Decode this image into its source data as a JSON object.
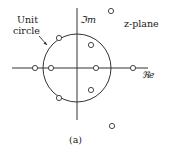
{
  "diagram": {
    "plane_label": "z-plane",
    "imag_axis_label": "ℑm",
    "real_axis_label": "ℜe",
    "unit_circle_label_line1": "Unit",
    "unit_circle_label_line2": "circle",
    "caption": "(a)",
    "colors": {
      "stroke": "#333333",
      "background": "#ffffff"
    },
    "zeros": [
      {
        "x": 35,
        "y": 68,
        "desc": "on real axis outside unit circle (left)"
      },
      {
        "x": 51,
        "y": 68,
        "desc": "on real axis inside unit circle (left)"
      },
      {
        "x": 96,
        "y": 68,
        "desc": "on real axis inside unit circle (right)"
      },
      {
        "x": 133,
        "y": 68,
        "desc": "on real axis outside unit circle (right)"
      },
      {
        "x": 59,
        "y": 38,
        "desc": "on unit circle upper-left"
      },
      {
        "x": 59,
        "y": 98,
        "desc": "on unit circle lower-left"
      },
      {
        "x": 91,
        "y": 45,
        "desc": "inside unit circle upper-right"
      },
      {
        "x": 91,
        "y": 90,
        "desc": "inside unit circle lower-right"
      },
      {
        "x": 111,
        "y": 11,
        "desc": "outside unit circle upper-right"
      },
      {
        "x": 112,
        "y": 126,
        "desc": "outside unit circle lower-right"
      }
    ]
  }
}
